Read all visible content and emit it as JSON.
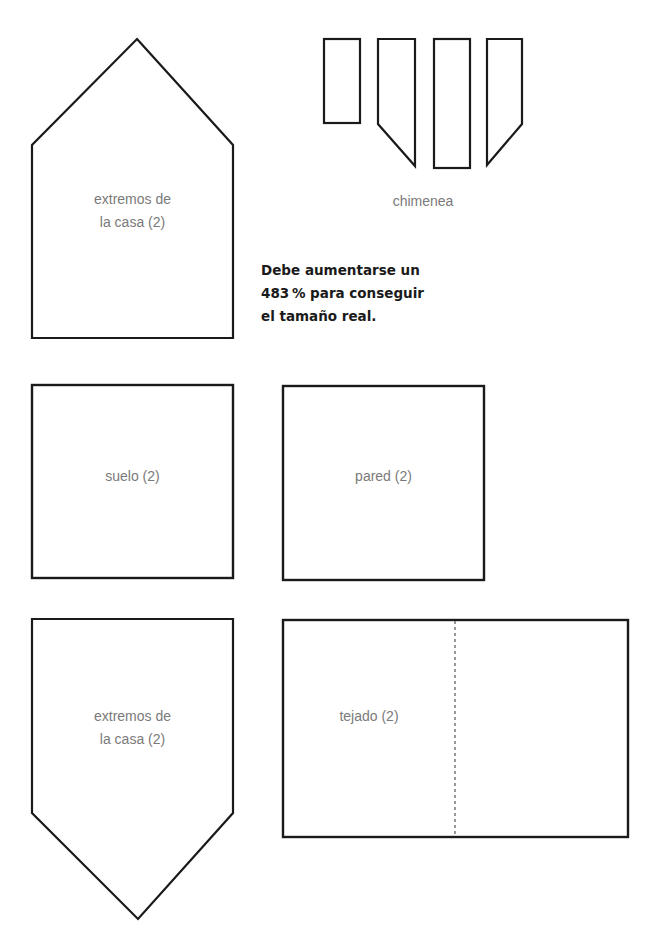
{
  "pieces": {
    "house_end_top": {
      "label_line1": "extremos de",
      "label_line2": "la casa (2)"
    },
    "chimney": {
      "label": "chimenea",
      "piece_count": 4
    },
    "floor": {
      "label": "suelo (2)"
    },
    "wall": {
      "label": "pared (2)"
    },
    "house_end_bottom": {
      "label_line1": "extremos de",
      "label_line2": "la casa (2)"
    },
    "roof": {
      "label": "tejado (2)"
    }
  },
  "note": {
    "line1": "Debe aumentarse un",
    "line2": "483 % para conseguir",
    "line3": "el tamaño real."
  },
  "colors": {
    "outline": "#1a1a1a",
    "label_text": "#7a7a7a",
    "note_text": "#1a1a1a",
    "background": "#ffffff"
  }
}
